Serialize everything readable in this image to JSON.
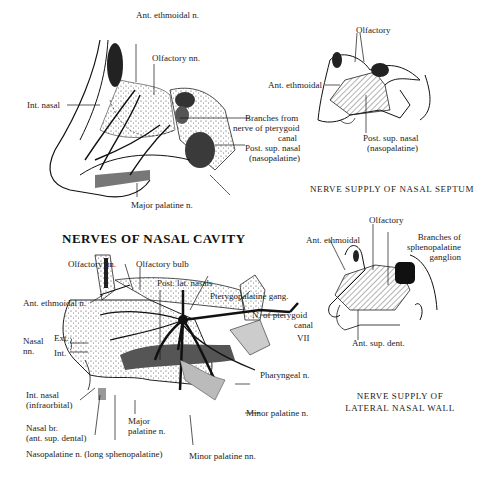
{
  "main_title": "NERVES OF NASAL CAVITY",
  "panels": {
    "septum_detail": {
      "labels": {
        "ant_ethmoidal": "Ant. ethmoidal n.",
        "olfactory": "Olfactory nn.",
        "int_nasal": "Int. nasal",
        "branches_pterygoid_1": "Branches from",
        "branches_pterygoid_2": "nerve of pterygoid",
        "branches_pterygoid_3": "canal",
        "post_sup_nasal_1": "Post. sup. nasal",
        "post_sup_nasal_2": "(nasopalatine)",
        "major_palatine": "Major palatine n."
      }
    },
    "septum_schematic": {
      "caption": "NERVE SUPPLY OF NASAL SEPTUM",
      "labels": {
        "olfactory": "Olfactory",
        "ant_ethmoidal": "Ant. ethmoidal",
        "post_sup_nasal_1": "Post. sup. nasal",
        "post_sup_nasal_2": "(nasopalatine)"
      }
    },
    "lateral_detail": {
      "labels": {
        "olfactory_nn": "Olfactory nn.",
        "olfactory_bulb": "Olfactory bulb",
        "post_lat_nasals": "Post. lat. nasals",
        "pterygopalatine_gang": "Pterygopalatine gang.",
        "n_pterygoid_1": "N. of pterygoid",
        "n_pterygoid_2": "canal",
        "vii": "VII",
        "ant_ethmoidal": "Ant. ethmoidal n.",
        "nasal_nn_1": "Nasal",
        "nasal_nn_2": "nn.",
        "ext": "Ext.",
        "int": "Int.",
        "pharyngeal": "Pharyngeal n.",
        "int_nasal_1": "Int. nasal",
        "int_nasal_2": "(infraorbital)",
        "minor_palatine": "Minor palatine n.",
        "nasal_br_1": "Nasal br.",
        "nasal_br_2": "(ant. sup. dental)",
        "major_palatine_1": "Major",
        "major_palatine_2": "palatine n.",
        "nasopalatine": "Nasopalatine n. (long sphenopalatine)",
        "minor_palatine_nn": "Minor palatine nn."
      }
    },
    "lateral_schematic": {
      "caption_1": "NERVE SUPPLY OF",
      "caption_2": "LATERAL NASAL WALL",
      "labels": {
        "olfactory": "Olfactory",
        "ant_ethmoidal": "Ant. ethmoidal",
        "branches_1": "Branches of",
        "branches_2": "sphenopalatine",
        "branches_3": "ganglion",
        "ant_sup_dent": "Ant. sup. dent."
      }
    }
  }
}
